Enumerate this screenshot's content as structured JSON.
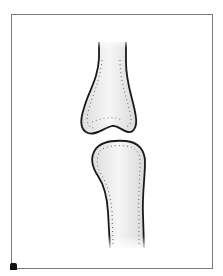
{
  "illustration": {
    "subject": "joint-bones",
    "parts": [
      "upper-bone",
      "lower-bone"
    ],
    "colors": {
      "outline": "#1a1a1a",
      "bone_fill": "#e9e9e9",
      "bone_highlight": "#f7f7f7",
      "dots": "#666666",
      "frame": "#7a7a7a",
      "background": "#ffffff"
    }
  }
}
